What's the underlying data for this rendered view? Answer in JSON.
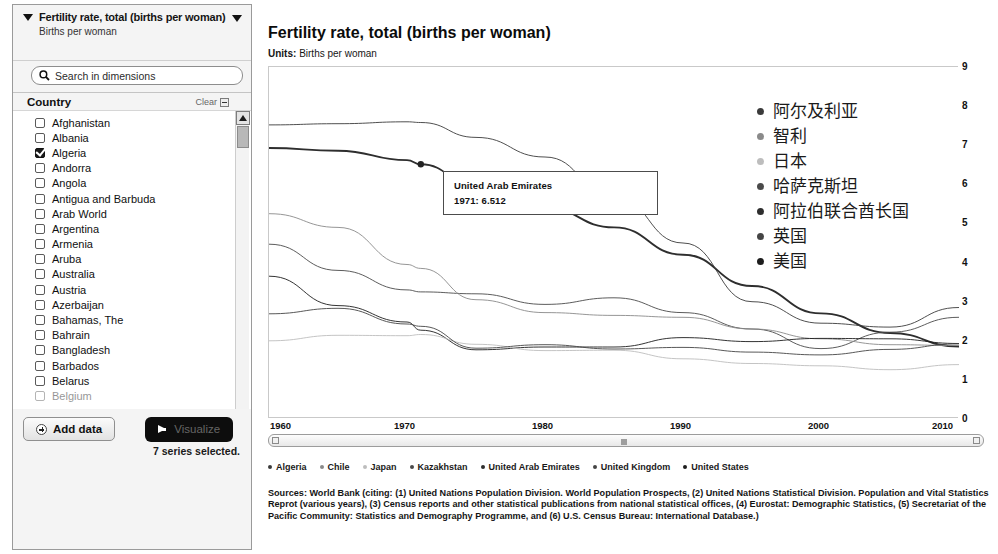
{
  "sidebar": {
    "dimension": {
      "title": "Fertility rate, total (births per woman)",
      "subtitle": "Births per woman",
      "collapse_icon": "triangle-down-icon",
      "dropdown_icon": "triangle-down-icon"
    },
    "search": {
      "placeholder": "Search in dimensions",
      "value": "",
      "icon": "search-icon"
    },
    "facet": {
      "title": "Country",
      "clear_label": "Clear",
      "clear_icon": "collapse-box-icon"
    },
    "countries": [
      {
        "name": "Afghanistan",
        "checked": false
      },
      {
        "name": "Albania",
        "checked": false
      },
      {
        "name": "Algeria",
        "checked": true
      },
      {
        "name": "Andorra",
        "checked": false
      },
      {
        "name": "Angola",
        "checked": false
      },
      {
        "name": "Antigua and Barbuda",
        "checked": false
      },
      {
        "name": "Arab World",
        "checked": false
      },
      {
        "name": "Argentina",
        "checked": false
      },
      {
        "name": "Armenia",
        "checked": false
      },
      {
        "name": "Aruba",
        "checked": false
      },
      {
        "name": "Australia",
        "checked": false
      },
      {
        "name": "Austria",
        "checked": false
      },
      {
        "name": "Azerbaijan",
        "checked": false
      },
      {
        "name": "Bahamas, The",
        "checked": false
      },
      {
        "name": "Bahrain",
        "checked": false
      },
      {
        "name": "Bangladesh",
        "checked": false
      },
      {
        "name": "Barbados",
        "checked": false
      },
      {
        "name": "Belarus",
        "checked": false
      },
      {
        "name": "Belgium",
        "checked": false
      }
    ],
    "buttons": {
      "add_data": "Add data",
      "add_data_icon": "plus-circle-icon",
      "visualize": "Visualize",
      "visualize_icon": "arrow-right-icon"
    },
    "status": "7 series selected."
  },
  "chart_header": {
    "title": "Fertility rate, total (births per woman)",
    "units_label": "Units:",
    "units_value": "Births per woman"
  },
  "tooltip": {
    "series": "United Arab Emirates",
    "value": "1971: 6.512"
  },
  "cjk_legend": [
    {
      "label": "阿尔及利亚",
      "color": "#3b3b3b"
    },
    {
      "label": "智利",
      "color": "#8a8a8a"
    },
    {
      "label": "日本",
      "color": "#bdbdbd"
    },
    {
      "label": "哈萨克斯坦",
      "color": "#4a4a4a"
    },
    {
      "label": "阿拉伯联合酋长国",
      "color": "#2e2e2e"
    },
    {
      "label": "英国",
      "color": "#454545"
    },
    {
      "label": "美国",
      "color": "#1d1d1d"
    }
  ],
  "legend": [
    {
      "label": "Algeria",
      "color": "#3b3b3b"
    },
    {
      "label": "Chile",
      "color": "#8a8a8a"
    },
    {
      "label": "Japan",
      "color": "#bdbdbd"
    },
    {
      "label": "Kazakhstan",
      "color": "#4a4a4a"
    },
    {
      "label": "United Arab Emirates",
      "color": "#2e2e2e"
    },
    {
      "label": "United Kingdom",
      "color": "#454545"
    },
    {
      "label": "United States",
      "color": "#1d1d1d"
    }
  ],
  "sources": {
    "label": "Sources:",
    "text": " World Bank (citing: (1) United Nations Population Division. World Population Prospects, (2) United Nations Statistical Division. Population and Vital Statistics Reprot (various years), (3) Census reports and other statistical publications from national statistical offices, (4) Eurostat: Demographic Statistics, (5) Secretariat of the Pacific Community: Statistics and Demography Programme, and (6) U.S. Census Bureau: International Database.)"
  },
  "chart_data": {
    "type": "line",
    "title": "Fertility rate, total (births per woman)",
    "xlabel": "",
    "ylabel": "Births per woman",
    "xlim": [
      1960,
      2010
    ],
    "ylim": [
      0,
      9
    ],
    "grid": false,
    "legend_position": "bottom",
    "x_ticks": [
      1960,
      1970,
      1980,
      1990,
      2000,
      2010
    ],
    "y_ticks": [
      0,
      1,
      2,
      3,
      4,
      5,
      6,
      7,
      8,
      9
    ],
    "x": [
      1960,
      1965,
      1970,
      1971,
      1975,
      1980,
      1985,
      1990,
      1995,
      2000,
      2005,
      2010
    ],
    "series": [
      {
        "name": "United Arab Emirates",
        "color": "#2e2e2e",
        "values": [
          6.93,
          6.86,
          6.62,
          6.512,
          5.95,
          5.4,
          4.9,
          4.2,
          3.4,
          2.7,
          2.2,
          1.85
        ]
      },
      {
        "name": "Algeria",
        "color": "#3b3b3b",
        "values": [
          7.52,
          7.55,
          7.6,
          7.58,
          7.2,
          6.7,
          5.7,
          4.5,
          3.0,
          2.45,
          2.35,
          2.85
        ]
      },
      {
        "name": "Kazakhstan",
        "color": "#4a4a4a",
        "values": [
          4.47,
          3.8,
          3.3,
          3.25,
          3.2,
          2.93,
          3.1,
          2.72,
          2.3,
          1.8,
          2.22,
          2.6
        ]
      },
      {
        "name": "Chile",
        "color": "#8a8a8a",
        "values": [
          5.25,
          4.9,
          3.95,
          3.85,
          3.05,
          2.72,
          2.65,
          2.6,
          2.3,
          2.05,
          1.9,
          1.88
        ]
      },
      {
        "name": "United States",
        "color": "#1d1d1d",
        "values": [
          3.65,
          2.9,
          2.48,
          2.27,
          1.77,
          1.84,
          1.84,
          2.08,
          1.98,
          2.06,
          2.05,
          1.93
        ]
      },
      {
        "name": "Japan",
        "color": "#bdbdbd",
        "values": [
          2.0,
          2.14,
          2.13,
          2.16,
          1.91,
          1.75,
          1.76,
          1.54,
          1.42,
          1.36,
          1.26,
          1.39
        ]
      },
      {
        "name": "United Kingdom",
        "color": "#454545",
        "values": [
          2.69,
          2.83,
          2.43,
          2.37,
          1.81,
          1.9,
          1.79,
          1.83,
          1.71,
          1.64,
          1.78,
          1.92
        ]
      }
    ],
    "annotation": {
      "series": "United Arab Emirates",
      "x": 1971,
      "y": 6.512,
      "text": "1971: 6.512"
    }
  }
}
